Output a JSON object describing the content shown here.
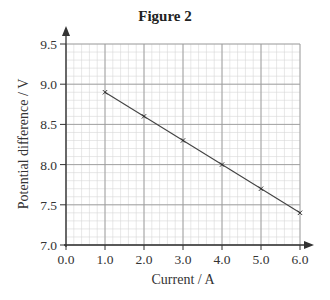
{
  "figure": {
    "title": "Figure 2"
  },
  "chart_data": {
    "type": "line",
    "title": "Figure 2",
    "xlabel": "Current / A",
    "ylabel": "Potential difference / V",
    "xlim": [
      0.0,
      6.0
    ],
    "ylim": [
      7.0,
      9.5
    ],
    "x_ticks": [
      "0.0",
      "1.0",
      "2.0",
      "3.0",
      "4.0",
      "5.0",
      "6.0"
    ],
    "y_ticks": [
      "7.0",
      "7.5",
      "8.0",
      "8.5",
      "9.0",
      "9.5"
    ],
    "grid": {
      "on": true,
      "major_x": 1.0,
      "major_y": 0.5,
      "minor_x": 0.2,
      "minor_y": 0.1
    },
    "marker": "x",
    "series": [
      {
        "name": "Potential difference",
        "x": [
          1.0,
          2.0,
          3.0,
          4.0,
          5.0,
          6.0
        ],
        "y": [
          8.9,
          8.6,
          8.3,
          8.0,
          7.7,
          7.4
        ]
      }
    ],
    "fit_line": {
      "from": [
        1.0,
        8.9
      ],
      "to": [
        6.0,
        7.4
      ]
    },
    "legend": null
  },
  "style": {
    "axis_color": "#333333",
    "major_grid_color": "#9a9a9a",
    "minor_grid_color": "#d6d6d6",
    "line_color": "#444444"
  }
}
